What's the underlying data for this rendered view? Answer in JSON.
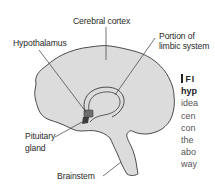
{
  "figure": {
    "type": "anatomical-diagram",
    "colors": {
      "brain_fill": "#dcdcdc",
      "outline": "#3a3a3a",
      "hypothalamus_fill": "#6e6e6e",
      "pituitary_fill": "#3c3c3c",
      "label_text": "#2a2a2a",
      "caption_text": "#555555"
    },
    "labels": {
      "cerebral_cortex": "Cerebral cortex",
      "limbic_line1": "Portion of",
      "limbic_line2": "limbic system",
      "hypothalamus": "Hypothalamus",
      "pituitary_line1": "Pituitary",
      "pituitary_line2": "gland",
      "brainstem": "Brainstem"
    }
  },
  "caption": {
    "heading": "FI",
    "lines": [
      "hyp",
      "idea",
      "cen",
      "con",
      "the",
      "abo",
      "way"
    ]
  }
}
